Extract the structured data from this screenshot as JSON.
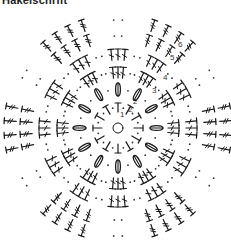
{
  "title": "Häkelschrift",
  "colors": {
    "ink": "#1a1a1a",
    "background": "#ffffff"
  },
  "center": {
    "x": 118,
    "y": 128
  },
  "row_labels": [
    {
      "label": "1",
      "x": 120,
      "y": 117
    },
    {
      "label": "2",
      "x": 128,
      "y": 112
    },
    {
      "label": "2",
      "x": 133,
      "y": 104
    },
    {
      "label": "3",
      "x": 152,
      "y": 93
    },
    {
      "label": "4",
      "x": 163,
      "y": 80
    },
    {
      "label": "5",
      "x": 170,
      "y": 60
    },
    {
      "label": "6",
      "x": 178,
      "y": 47
    }
  ],
  "rows": [
    {
      "name": "row-1",
      "type": "T-stitch",
      "radius": 16,
      "count": 12,
      "len": 9
    },
    {
      "name": "row-2",
      "type": "cluster",
      "radius": 32,
      "count": 12,
      "len": 13
    },
    {
      "name": "row-3",
      "type": "dc",
      "radius": 50,
      "count": 12,
      "group": 3,
      "len": 11
    },
    {
      "name": "row-4",
      "type": "dc",
      "radius": 68,
      "count": 12,
      "group": 3,
      "len": 11
    },
    {
      "name": "row-5",
      "type": "tr",
      "radius": 86,
      "count": 6,
      "group": 4,
      "len": 12
    },
    {
      "name": "row-6",
      "type": "tr",
      "radius": 102,
      "count": 6,
      "group": 4,
      "len": 12
    }
  ]
}
